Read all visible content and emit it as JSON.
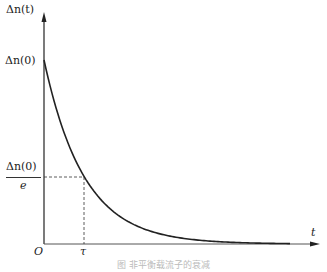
{
  "figure": {
    "y_axis_label": "Δn(t)",
    "x_axis_label": "t",
    "origin_label": "O",
    "y_initial_label": "Δn(0)",
    "y_fraction_numerator": "Δn(0)",
    "y_fraction_denominator": "e",
    "x_tau_label": "τ",
    "caption": "图 非平衡载流子的衰减",
    "curve_color": "#222222"
  },
  "chart_data": {
    "type": "line",
    "title": "",
    "xlabel": "t",
    "ylabel": "Δn(t)",
    "series": [
      {
        "name": "Δn(t) = Δn(0)·e^(-t/τ)",
        "x": [
          0,
          0.5,
          1,
          2,
          3,
          4,
          5,
          6
        ],
        "values": [
          1.0,
          0.607,
          0.368,
          0.135,
          0.05,
          0.018,
          0.007,
          0.002
        ]
      }
    ],
    "annotations": [
      {
        "type": "dashed-guide",
        "x": 1,
        "y": 0.368,
        "x_label": "τ",
        "y_label": "Δn(0)/e"
      }
    ],
    "grid": false
  }
}
